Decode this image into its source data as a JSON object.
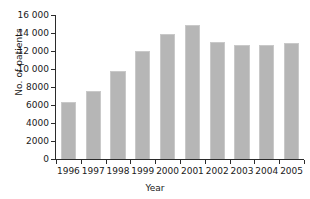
{
  "chart_data": {
    "type": "bar",
    "title": "",
    "xlabel": "Year",
    "ylabel": "No. of patients",
    "categories": [
      "1996",
      "1997",
      "1998",
      "1999",
      "2000",
      "2001",
      "2002",
      "2003",
      "2004",
      "2005"
    ],
    "values": [
      6300,
      7600,
      9750,
      12050,
      13900,
      14900,
      13050,
      12650,
      12700,
      12850
    ],
    "ylim": [
      0,
      16000
    ],
    "ytick_values": [
      0,
      2000,
      4000,
      6000,
      8000,
      10000,
      12000,
      14000,
      16000
    ],
    "ytick_labels": [
      "0",
      "2000",
      "4000",
      "6000",
      "8000",
      "10 000",
      "12 000",
      "14 000",
      "16 000"
    ],
    "grid": false,
    "legend": false,
    "bar_color": "#b6b6b6",
    "axis_color": "#2b2b2b",
    "background_color": "#ffffff"
  }
}
